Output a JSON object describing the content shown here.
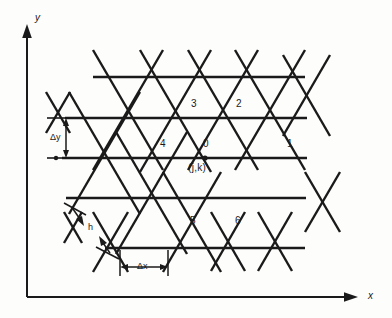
{
  "figure": {
    "background_color": "#fdfdfc",
    "line_color": "#1a1a1a"
  },
  "axes": {
    "x_label": "x",
    "y_label": "y",
    "origin": {
      "x": 27,
      "y": 297
    },
    "x_end": {
      "x": 358,
      "y": 297
    },
    "y_end": {
      "x": 27,
      "y": 28
    }
  },
  "annotations": {
    "delta_y": {
      "label": "Δy",
      "x": 50,
      "y": 133,
      "from_y": 118,
      "to_y": 158,
      "at_x": 66
    },
    "delta_x": {
      "label": "Δx",
      "x": 137,
      "y": 268,
      "from_x": 120,
      "to_x": 168,
      "at_y": 267
    },
    "h": {
      "label": "h",
      "x": 88,
      "y": 228
    }
  },
  "nodes": [
    {
      "label": "0",
      "lx": 203,
      "ly": 144,
      "nx": 205,
      "ny": 158
    },
    {
      "label": "1",
      "lx": 287,
      "ly": 144,
      "nx": 290,
      "ny": 158
    },
    {
      "label": "2",
      "lx": 236,
      "ly": 103,
      "nx": 241,
      "ny": 118
    },
    {
      "label": "3",
      "lx": 191,
      "ly": 103,
      "nx": 196,
      "ny": 118
    },
    {
      "label": "4",
      "lx": 160,
      "ly": 144,
      "nx": 163,
      "ny": 158
    },
    {
      "label": "5",
      "lx": 190,
      "ly": 222,
      "nx": 192,
      "ny": 198
    },
    {
      "label": "6",
      "lx": 235,
      "ly": 222,
      "nx": 240,
      "ny": 198
    }
  ],
  "center_coordinate": {
    "label": "(j,k)",
    "x": 190,
    "y": 168
  },
  "lattice": {
    "rows": [
      {
        "y": 77,
        "x_start": 93,
        "x_end": 305
      },
      {
        "y": 118,
        "x_start": 65,
        "x_end": 307
      },
      {
        "y": 158,
        "x_start": 62,
        "x_end": 307
      },
      {
        "y": 198,
        "x_start": 66,
        "x_end": 306
      },
      {
        "y": 248,
        "x_start": 105,
        "x_end": 305
      }
    ],
    "row_spacing": 40,
    "node_spacing": 47.5
  }
}
